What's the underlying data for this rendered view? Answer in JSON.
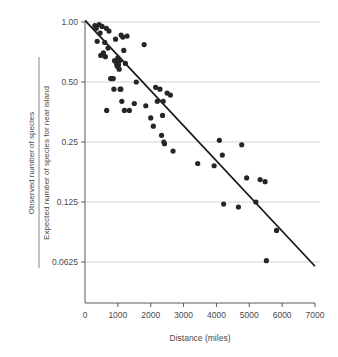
{
  "chart_data": {
    "type": "scatter",
    "title": "",
    "xlabel": "Distance (miles)",
    "ylabel_numerator": "Observed number of species",
    "ylabel_denominator": "Expected number of species for near island",
    "xlim": [
      0,
      7000
    ],
    "ylim": [
      0.0625,
      1.0
    ],
    "yscale": "log2",
    "grid": true,
    "legend": "none",
    "xticks": [
      0,
      1000,
      2000,
      3000,
      4000,
      5000,
      6000,
      7000
    ],
    "xtick_labels": [
      "0",
      "1000",
      "2000",
      "3000",
      "4000",
      "5000",
      "6000",
      "7000"
    ],
    "yticks": [
      1.0,
      0.5,
      0.25,
      0.125,
      0.0625
    ],
    "ytick_labels": [
      "1.00",
      "0.50",
      "0.25",
      "0.125",
      "0.0625"
    ],
    "point_color": "#262626",
    "line_color": "#1a1a1a",
    "grid_color": "#c8c8c8",
    "axis_color": "#5a5a5a",
    "points": [
      [
        300,
        0.96
      ],
      [
        340,
        0.93
      ],
      [
        370,
        0.8
      ],
      [
        430,
        0.97
      ],
      [
        460,
        0.88
      ],
      [
        480,
        0.68
      ],
      [
        520,
        0.95
      ],
      [
        560,
        0.7
      ],
      [
        600,
        0.79
      ],
      [
        620,
        0.67
      ],
      [
        650,
        0.93
      ],
      [
        660,
        0.36
      ],
      [
        700,
        0.74
      ],
      [
        730,
        0.9
      ],
      [
        780,
        0.52
      ],
      [
        820,
        0.52
      ],
      [
        860,
        0.52
      ],
      [
        880,
        0.46
      ],
      [
        900,
        0.64
      ],
      [
        930,
        0.82
      ],
      [
        960,
        0.62
      ],
      [
        980,
        0.6
      ],
      [
        1000,
        0.66
      ],
      [
        1010,
        0.63
      ],
      [
        1020,
        0.61
      ],
      [
        1040,
        0.58
      ],
      [
        1050,
        0.64
      ],
      [
        1070,
        0.46
      ],
      [
        1090,
        0.46
      ],
      [
        1100,
        0.86
      ],
      [
        1120,
        0.4
      ],
      [
        1150,
        0.84
      ],
      [
        1180,
        0.72
      ],
      [
        1200,
        0.36
      ],
      [
        1230,
        0.62
      ],
      [
        1280,
        0.85
      ],
      [
        1350,
        0.36
      ],
      [
        1500,
        0.39
      ],
      [
        1560,
        0.5
      ],
      [
        1800,
        0.77
      ],
      [
        1850,
        0.38
      ],
      [
        2000,
        0.33
      ],
      [
        2080,
        0.3
      ],
      [
        2150,
        0.47
      ],
      [
        2200,
        0.4
      ],
      [
        2280,
        0.46
      ],
      [
        2330,
        0.27
      ],
      [
        2360,
        0.34
      ],
      [
        2380,
        0.4
      ],
      [
        2400,
        0.25
      ],
      [
        2420,
        0.245
      ],
      [
        2500,
        0.44
      ],
      [
        2600,
        0.43
      ],
      [
        2680,
        0.225
      ],
      [
        3430,
        0.195
      ],
      [
        3930,
        0.19
      ],
      [
        4090,
        0.255
      ],
      [
        4180,
        0.215
      ],
      [
        4220,
        0.122
      ],
      [
        4670,
        0.118
      ],
      [
        4770,
        0.242
      ],
      [
        4920,
        0.165
      ],
      [
        5200,
        0.125
      ],
      [
        5330,
        0.162
      ],
      [
        5480,
        0.158
      ],
      [
        5520,
        0.0635
      ],
      [
        5830,
        0.09
      ]
    ],
    "fit_line": {
      "x_start": 0,
      "y_start": 1.02,
      "x_end": 7000,
      "y_end": 0.0595
    }
  }
}
